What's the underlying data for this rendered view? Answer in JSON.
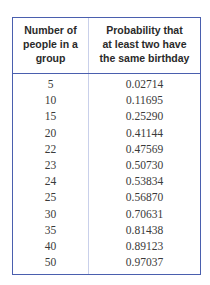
{
  "table": {
    "headers": [
      [
        "Number of",
        "people in a",
        "group"
      ],
      [
        "Probability that",
        "at least two have",
        "the same birthday"
      ]
    ],
    "rows": [
      {
        "n": "5",
        "p": "0.02714"
      },
      {
        "n": "10",
        "p": "0.11695"
      },
      {
        "n": "15",
        "p": "0.25290"
      },
      {
        "n": "20",
        "p": "0.41144"
      },
      {
        "n": "22",
        "p": "0.47569"
      },
      {
        "n": "23",
        "p": "0.50730"
      },
      {
        "n": "24",
        "p": "0.53834"
      },
      {
        "n": "25",
        "p": "0.56870"
      },
      {
        "n": "30",
        "p": "0.70631"
      },
      {
        "n": "35",
        "p": "0.81438"
      },
      {
        "n": "40",
        "p": "0.89123"
      },
      {
        "n": "50",
        "p": "0.97037"
      }
    ],
    "colors": {
      "border": "#4a5fae",
      "divider": "#c9d0ea"
    }
  }
}
